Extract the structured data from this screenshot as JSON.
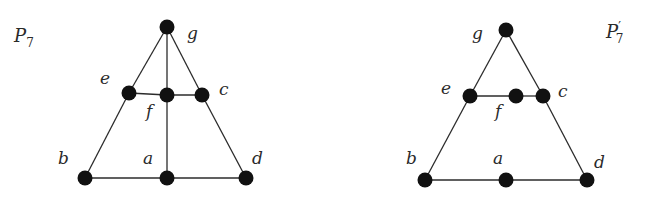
{
  "graphs": [
    {
      "id": "P7",
      "title": "P",
      "subscript": "7",
      "prime": "",
      "title_pos": [
        14,
        42
      ],
      "nodes": [
        {
          "id": "g",
          "label": "g",
          "x": 167,
          "y": 27,
          "lx": 187,
          "ly": 39
        },
        {
          "id": "e",
          "label": "e",
          "x": 129,
          "y": 93,
          "lx": 100,
          "ly": 84
        },
        {
          "id": "f",
          "label": "f",
          "x": 167,
          "y": 95,
          "lx": 146,
          "ly": 117
        },
        {
          "id": "c",
          "label": "c",
          "x": 202,
          "y": 95,
          "lx": 219,
          "ly": 95
        },
        {
          "id": "b",
          "label": "b",
          "x": 85,
          "y": 178,
          "lx": 58,
          "ly": 164
        },
        {
          "id": "a",
          "label": "a",
          "x": 167,
          "y": 178,
          "lx": 143,
          "ly": 164
        },
        {
          "id": "d",
          "label": "d",
          "x": 246,
          "y": 178,
          "lx": 252,
          "ly": 164
        }
      ],
      "edges": [
        [
          "g",
          "e"
        ],
        [
          "g",
          "f"
        ],
        [
          "g",
          "c"
        ],
        [
          "e",
          "f"
        ],
        [
          "f",
          "c"
        ],
        [
          "e",
          "b"
        ],
        [
          "c",
          "d"
        ],
        [
          "f",
          "a"
        ],
        [
          "b",
          "a"
        ],
        [
          "a",
          "d"
        ]
      ]
    },
    {
      "id": "P7prime",
      "title": "P",
      "subscript": "7",
      "prime": "′",
      "title_pos": [
        606,
        38
      ],
      "nodes": [
        {
          "id": "g",
          "label": "g",
          "x": 506,
          "y": 30,
          "lx": 472,
          "ly": 39
        },
        {
          "id": "e",
          "label": "e",
          "x": 470,
          "y": 96,
          "lx": 441,
          "ly": 94
        },
        {
          "id": "f",
          "label": "f",
          "x": 516,
          "y": 96,
          "lx": 495,
          "ly": 117
        },
        {
          "id": "c",
          "label": "c",
          "x": 543,
          "y": 96,
          "lx": 558,
          "ly": 97
        },
        {
          "id": "b",
          "label": "b",
          "x": 425,
          "y": 180,
          "lx": 406,
          "ly": 164
        },
        {
          "id": "a",
          "label": "a",
          "x": 506,
          "y": 180,
          "lx": 493,
          "ly": 164
        },
        {
          "id": "d",
          "label": "d",
          "x": 587,
          "y": 180,
          "lx": 594,
          "ly": 168
        }
      ],
      "edges": [
        [
          "g",
          "e"
        ],
        [
          "g",
          "c"
        ],
        [
          "e",
          "f"
        ],
        [
          "f",
          "c"
        ],
        [
          "e",
          "b"
        ],
        [
          "c",
          "d"
        ],
        [
          "b",
          "a"
        ],
        [
          "a",
          "d"
        ]
      ]
    }
  ],
  "style": {
    "node_radius": 7.5,
    "node_color": "#111111",
    "edge_color": "#2b2b2b"
  }
}
